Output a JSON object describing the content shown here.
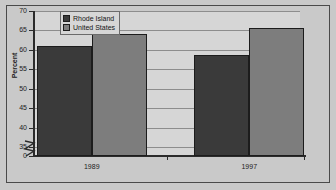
{
  "chart_data": {
    "type": "bar",
    "title": "",
    "xlabel": "",
    "ylabel": "Percent",
    "categories": [
      "1989",
      "1997"
    ],
    "series": [
      {
        "name": "Rhode Island",
        "values": [
          61.0,
          58.7
        ],
        "color": "#3a3a3a"
      },
      {
        "name": "United States",
        "values": [
          64.0,
          65.7
        ],
        "color": "#7d7d7d"
      }
    ],
    "ylim": [
      35,
      70
    ],
    "yticks": [
      70,
      65,
      60,
      55,
      50,
      45,
      40,
      35,
      0
    ],
    "axis_break": true,
    "grid": true,
    "legend_position": "top-left"
  },
  "legend": {
    "items": [
      {
        "label": "Rhode Island"
      },
      {
        "label": "United States"
      }
    ]
  },
  "axes": {
    "y_title": "Percent",
    "y_tick_labels": [
      "70",
      "65",
      "60",
      "55",
      "50",
      "45",
      "40",
      "35",
      "0"
    ],
    "x_tick_labels": [
      "1989",
      "1997"
    ]
  },
  "colors": {
    "series_rhode_island": "#3a3a3a",
    "series_united_states": "#7d7d7d",
    "plot_background": "#d6d6d6",
    "figure_background": "#c9c9c9",
    "gridline": "#8d8d8d",
    "axis": "#2b2b2b"
  }
}
